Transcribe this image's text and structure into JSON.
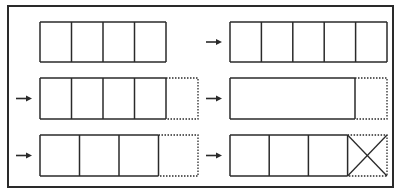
{
  "diagram": {
    "colors": {
      "stroke": "#2a2a2a",
      "background": "#ffffff"
    },
    "frame": {
      "x": 8,
      "y": 6,
      "w": 385,
      "h": 181
    },
    "panels": [
      {
        "id": "row1-left",
        "arrow": false,
        "x": 40,
        "y": 22,
        "h": 40,
        "cells": [
          31.5,
          31.5,
          31.5,
          31.5
        ],
        "extension": null,
        "crossed_last": false
      },
      {
        "id": "row1-right",
        "arrow": true,
        "x": 230,
        "y": 22,
        "h": 40,
        "cells": [
          31.4,
          31.4,
          31.4,
          31.4,
          31.4
        ],
        "extension": null,
        "crossed_last": false
      },
      {
        "id": "row2-left",
        "arrow": true,
        "x": 40,
        "y": 78,
        "h": 41,
        "cells": [
          31.5,
          31.5,
          31.5,
          31.5
        ],
        "extension": 32,
        "crossed_last": false
      },
      {
        "id": "row2-right",
        "arrow": true,
        "x": 230,
        "y": 78,
        "h": 41,
        "cells": [
          125
        ],
        "extension": 32,
        "crossed_last": false
      },
      {
        "id": "row3-left",
        "arrow": true,
        "x": 40,
        "y": 135,
        "h": 41,
        "cells": [
          39.5,
          39.5,
          39.5
        ],
        "extension": 39.5,
        "crossed_last": false
      },
      {
        "id": "row3-right",
        "arrow": true,
        "x": 230,
        "y": 135,
        "h": 41,
        "cells": [
          39.2,
          39.2,
          39.2
        ],
        "extension": 39.4,
        "crossed_last": true
      }
    ]
  }
}
